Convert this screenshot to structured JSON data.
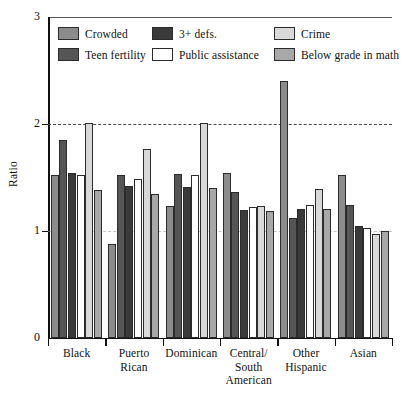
{
  "chart_data": {
    "type": "bar",
    "title": "",
    "subtitle": "",
    "xlabel": "",
    "ylabel": "Ratio",
    "ylim": [
      0,
      3
    ],
    "yticks": [
      0,
      1,
      2,
      3
    ],
    "ytick_labels": [
      "0",
      "1",
      "2",
      "3"
    ],
    "grid": "horizontal dashed gridline at y=2, faint dashed at y=1",
    "legend_position": "inside top, two rows of three",
    "categories": [
      "Black",
      "Puerto Rican",
      "Dominican",
      "Central/ South American",
      "Other Hispanic",
      "Asian"
    ],
    "category_lines": [
      [
        "Black"
      ],
      [
        "Puerto",
        "Rican"
      ],
      [
        "Dominican"
      ],
      [
        "Central/",
        "South",
        "American"
      ],
      [
        "Other",
        "Hispanic"
      ],
      [
        "Asian"
      ]
    ],
    "series": [
      {
        "name": "Crowded",
        "color": "#8c8c8c",
        "values": [
          1.52,
          0.88,
          1.23,
          1.54,
          2.4,
          1.52
        ]
      },
      {
        "name": "Teen fertility",
        "color": "#555555",
        "values": [
          1.85,
          1.52,
          1.53,
          1.36,
          1.12,
          1.24
        ]
      },
      {
        "name": "3+ defs.",
        "color": "#3a3a3a",
        "values": [
          1.54,
          1.42,
          1.41,
          1.2,
          1.21,
          1.05
        ]
      },
      {
        "name": "Public assistance",
        "color": "#ffffff",
        "values": [
          1.52,
          1.49,
          1.52,
          1.22,
          1.24,
          1.03
        ]
      },
      {
        "name": "Crime",
        "color": "#d9d9d9",
        "values": [
          2.01,
          1.77,
          2.01,
          1.23,
          1.39,
          0.97
        ]
      },
      {
        "name": "Below grade in math",
        "color": "#a8a8a8",
        "values": [
          1.38,
          1.35,
          1.4,
          1.19,
          1.21,
          1.0
        ]
      }
    ],
    "bar_order_in_group": [
      "Crowded",
      "Teen fertility",
      "3+ defs.",
      "Public assistance",
      "Crime",
      "Below grade in math"
    ],
    "legend_entries": [
      {
        "label": "Crowded",
        "color": "#8c8c8c"
      },
      {
        "label": "3+ defs.",
        "color": "#3a3a3a"
      },
      {
        "label": "Crime",
        "color": "#d9d9d9"
      },
      {
        "label": "Teen fertility",
        "color": "#555555"
      },
      {
        "label": "Public assistance",
        "color": "#ffffff"
      },
      {
        "label": "Below grade in math",
        "color": "#a8a8a8"
      }
    ]
  }
}
